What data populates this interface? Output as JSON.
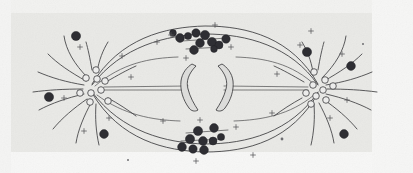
{
  "figure": {
    "caption": "",
    "domain": "scientific illustration",
    "medium": "engraved / halftone line drawing on grey paper plate",
    "background_color": "#e9e9e6",
    "ink_color": "#3b3b3d",
    "chromosome_color": "#2e2e33",
    "granule_fill": "#ececeb",
    "width": 413,
    "height": 173
  },
  "labels": {
    "none_visible": ""
  },
  "chart_data": {
    "type": "scatter",
    "xlabel": "",
    "ylabel": "",
    "xlim": [
      0,
      413
    ],
    "ylim": [
      0,
      173
    ],
    "grid": false,
    "legend": "none",
    "annotations": [
      "elliptical achromatic spindle spanning between two asters",
      "two curved rod chromosomes at the equator facing each other",
      "dense clusters of darkly stained chromosomes along the upper and lower spindle fibres",
      "centriole / centrosome granules drawn as small open circles at each pole",
      "radiating aster rays at both poles",
      "scattered dark cytoplasmic granules and small cross-shaped specks"
    ],
    "spindle": {
      "left_pole": [
        88,
        88
      ],
      "right_pole": [
        322,
        88
      ],
      "equator_x": 205,
      "outer_ellipse_ry": 46,
      "inner_ellipse_ry": 38,
      "mid_ellipse_ry": 22,
      "axis_line_y": 88
    },
    "series": [
      {
        "name": "dark chromosomes - upper cluster",
        "marker": "filled-circle",
        "color": "#2e2e33",
        "points": [
          [
            180,
            38,
            4.4
          ],
          [
            188,
            36,
            3.6
          ],
          [
            196,
            33,
            4.2
          ],
          [
            205,
            35,
            4.6
          ],
          [
            200,
            43,
            4.4
          ],
          [
            212,
            42,
            4.6
          ],
          [
            219,
            45,
            4.0
          ],
          [
            226,
            39,
            4.2
          ],
          [
            194,
            50,
            4.4
          ],
          [
            214,
            49,
            3.4
          ],
          [
            173,
            33,
            3.4
          ]
        ]
      },
      {
        "name": "dark chromosomes - lower cluster",
        "marker": "filled-circle",
        "color": "#2e2e33",
        "points": [
          [
            198,
            131,
            4.6
          ],
          [
            214,
            128,
            4.4
          ],
          [
            190,
            139,
            4.6
          ],
          [
            203,
            141,
            4.4
          ],
          [
            213,
            141,
            4.0
          ],
          [
            182,
            147,
            4.4
          ],
          [
            193,
            149,
            4.2
          ],
          [
            204,
            150,
            4.4
          ],
          [
            221,
            137,
            3.6
          ]
        ]
      },
      {
        "name": "scattered cytoplasmic granules",
        "marker": "filled-circle",
        "color": "#2e2e33",
        "points": [
          [
            76,
            36,
            4.6
          ],
          [
            49,
            97,
            4.6
          ],
          [
            104,
            134,
            4.4
          ],
          [
            307,
            52,
            4.6
          ],
          [
            351,
            66,
            4.4
          ],
          [
            344,
            134,
            4.4
          ],
          [
            282,
            139,
            3.0
          ]
        ]
      },
      {
        "name": "central rod chromosomes",
        "marker": "curved-rod",
        "color": "#dcdcda",
        "points": [
          [
            190,
            88
          ],
          [
            222,
            88
          ]
        ]
      },
      {
        "name": "centriole granules - left pole",
        "marker": "open-circle",
        "color": "#ececeb",
        "points": [
          [
            96,
            70,
            3.4
          ],
          [
            86,
            78,
            3.4
          ],
          [
            97,
            79,
            3.2
          ],
          [
            104,
            81,
            3.0
          ],
          [
            80,
            93,
            3.6
          ],
          [
            91,
            93,
            3.4
          ],
          [
            101,
            90,
            3.0
          ],
          [
            90,
            102,
            3.2
          ],
          [
            107,
            101,
            3.4
          ]
        ]
      },
      {
        "name": "centriole granules - right pole",
        "marker": "open-circle",
        "color": "#ececeb",
        "points": [
          [
            314,
            72,
            3.2
          ],
          [
            325,
            80,
            3.4
          ],
          [
            313,
            85,
            3.2
          ],
          [
            323,
            90,
            3.4
          ],
          [
            332,
            86,
            3.2
          ],
          [
            306,
            93,
            3.2
          ],
          [
            316,
            96,
            3.4
          ],
          [
            325,
            100,
            3.0
          ],
          [
            311,
            104,
            3.2
          ]
        ]
      },
      {
        "name": "cross specks",
        "marker": "plus",
        "color": "#55555a",
        "points": [
          [
            80,
            47
          ],
          [
            64,
            98
          ],
          [
            84,
            131
          ],
          [
            109,
            118
          ],
          [
            131,
            77
          ],
          [
            171,
            35
          ],
          [
            215,
            25
          ],
          [
            231,
            47
          ],
          [
            157,
            42
          ],
          [
            186,
            58
          ],
          [
            163,
            121
          ],
          [
            200,
            120
          ],
          [
            236,
            127
          ],
          [
            272,
            113
          ],
          [
            277,
            74
          ],
          [
            300,
            45
          ],
          [
            342,
            54
          ],
          [
            347,
            100
          ],
          [
            330,
            118
          ],
          [
            122,
            56
          ],
          [
            253,
            155
          ],
          [
            196,
            161
          ],
          [
            311,
            31
          ]
        ]
      }
    ]
  }
}
